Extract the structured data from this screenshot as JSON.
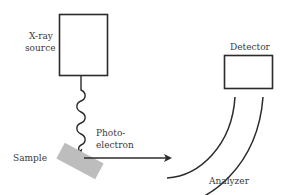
{
  "diagram": {
    "type": "XPS (X-ray photoelectron spectroscopy) schematic",
    "labels": {
      "xray_source_line1": "X-ray",
      "xray_source_line2": "source",
      "detector": "Detector",
      "photoelectron_line1": "Photo-",
      "photoelectron_line2": "electron",
      "sample": "Sample",
      "analyzer": "Analyzer"
    },
    "components": [
      {
        "name": "X-ray source",
        "shape": "rectangle"
      },
      {
        "name": "X-ray beam",
        "shape": "wavy-arrow",
        "from": "X-ray source",
        "to": "Sample"
      },
      {
        "name": "Sample",
        "shape": "tilted-rectangle"
      },
      {
        "name": "Photoelectron",
        "shape": "arrow",
        "from": "Sample",
        "to": "Analyzer"
      },
      {
        "name": "Analyzer",
        "shape": "concentric-arcs"
      },
      {
        "name": "Detector",
        "shape": "rectangle"
      }
    ],
    "colors": {
      "stroke": "#2b2b2b",
      "sample_fill": "#bdbdbd",
      "text": "#3a3a3a",
      "background": "#ffffff"
    }
  }
}
